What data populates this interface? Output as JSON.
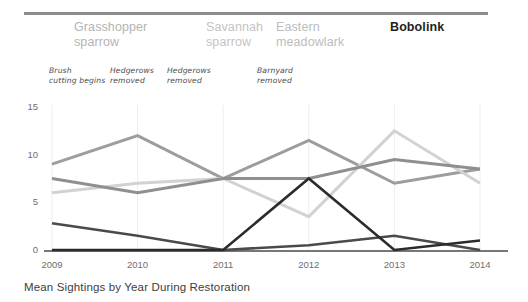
{
  "caption": "Mean Sightings by Year During Restoration",
  "legend": [
    {
      "line1": "Grasshopper",
      "line2": "sparrow",
      "color": "#b4b4b4",
      "x": 50
    },
    {
      "line1": "Savannah",
      "line2": "sparrow",
      "color": "#c4c4c4",
      "x": 182
    },
    {
      "line1": "Eastern",
      "line2": "meadowlark",
      "color": "#bcbcbc",
      "x": 252
    },
    {
      "line1": "Bobolink",
      "line2": "",
      "color": "#1f1f1f",
      "x": 366
    }
  ],
  "annotations": [
    {
      "line1": "Brush",
      "line2": "cutting begins",
      "x": 49
    },
    {
      "line1": "Hedgerows",
      "line2": "removed",
      "x": 110
    },
    {
      "line1": "Hedgerows",
      "line2": "removed",
      "x": 167
    },
    {
      "line1": "Barnyard",
      "line2": "removed",
      "x": 257
    }
  ],
  "chart_data": {
    "type": "line",
    "title": "Mean Sightings by Year During Restoration",
    "xlabel": "",
    "ylabel": "",
    "x": [
      "2009",
      "2010",
      "2011",
      "2012",
      "2013",
      "2014"
    ],
    "yticks": [
      0,
      5,
      10,
      15
    ],
    "ylim": [
      0,
      15
    ],
    "grid": "vertical",
    "legend_position": "top",
    "series": [
      {
        "name": "Grasshopper sparrow",
        "color": "#9d9d9d",
        "width": 3.0,
        "values": [
          9,
          12,
          7.5,
          11.5,
          7,
          8.5
        ]
      },
      {
        "name": "Savannah sparrow",
        "color": "#d2d2d2",
        "width": 3.0,
        "values": [
          6,
          7,
          7.5,
          3.5,
          12.5,
          7
        ]
      },
      {
        "name": "Eastern meadowlark",
        "color": "#8f8f8f",
        "width": 3.0,
        "values": [
          7.5,
          6,
          7.5,
          7.5,
          9.5,
          8.5
        ]
      },
      {
        "name": "Eastern meadowlark low",
        "color": "#4a4a4a",
        "width": 2.6,
        "values": [
          2.8,
          1.5,
          0,
          0.5,
          1.5,
          0
        ]
      },
      {
        "name": "Bobolink",
        "color": "#2b2b2b",
        "width": 2.6,
        "values": [
          0,
          0,
          0,
          7.5,
          0,
          1
        ]
      }
    ]
  }
}
